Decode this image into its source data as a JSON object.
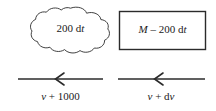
{
  "figure": {
    "background_color": "#ffffff",
    "stroke_color": "#1a1a1a",
    "cloud": {
      "name": "cloud-shape",
      "label_text": "200 dt",
      "label_parts": {
        "number": "200 d",
        "variable": "t"
      }
    },
    "box": {
      "name": "rectangle-shape",
      "label_text": "M – 200 dt",
      "label_parts": {
        "variable_lead": "M",
        "operator": " – ",
        "number": "200 d",
        "variable_trail": "t"
      }
    },
    "flows": [
      {
        "name": "flow-arrow-left",
        "direction": "left",
        "label_text": "v + 1000",
        "label_parts": {
          "variable": "v",
          "operator": " + ",
          "value": "1000"
        }
      },
      {
        "name": "flow-arrow-right",
        "direction": "left",
        "label_text": "v + dv",
        "label_parts": {
          "variable": "v",
          "operator": " + ",
          "differential": "d",
          "variable_trail": "v"
        }
      }
    ]
  }
}
